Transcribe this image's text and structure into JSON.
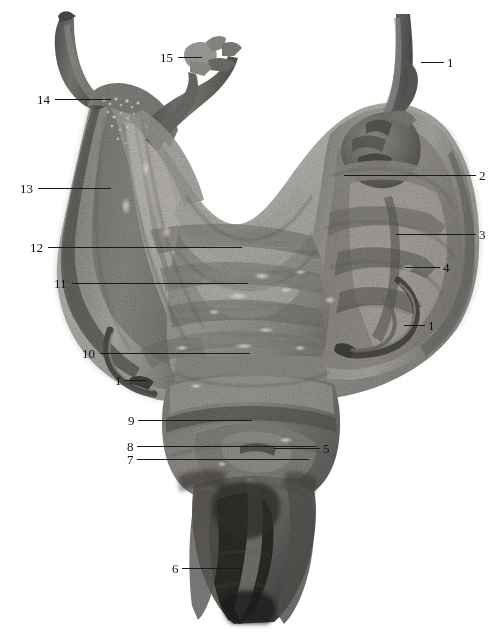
{
  "figure": {
    "kind": "anatomical-specimen-photograph",
    "orientation": "posterior view",
    "image_type": "grayscale photograph",
    "width_px": 499,
    "height_px": 635,
    "background_color": "#ffffff",
    "label_color": "#111111",
    "leader_line_color": "#1a1a1a",
    "tissue_tone_light": "#b9b7b2",
    "tissue_tone_mid": "#8e8c88",
    "tissue_tone_dark": "#5d5b58",
    "tissue_tone_darkest": "#2b2a28"
  },
  "labels": [
    {
      "id": "L1",
      "text": "1",
      "side": "right",
      "num_x": 447,
      "num_y": 56,
      "leader_x": 421,
      "leader_w": 23,
      "leader_y": 62
    },
    {
      "id": "L2",
      "text": "2",
      "side": "right",
      "num_x": 479,
      "num_y": 169,
      "leader_x": 344,
      "leader_w": 132,
      "leader_y": 175
    },
    {
      "id": "L3",
      "text": "3",
      "side": "right",
      "num_x": 479,
      "num_y": 228,
      "leader_x": 396,
      "leader_w": 80,
      "leader_y": 234
    },
    {
      "id": "L4",
      "text": "4",
      "side": "right",
      "num_x": 443,
      "num_y": 261,
      "leader_x": 405,
      "leader_w": 35,
      "leader_y": 267
    },
    {
      "id": "L1b",
      "text": "1",
      "side": "right",
      "num_x": 428,
      "num_y": 319,
      "leader_x": 404,
      "leader_w": 21,
      "leader_y": 325
    },
    {
      "id": "L5",
      "text": "5",
      "side": "right",
      "num_x": 323,
      "num_y": 442,
      "leader_x": 274,
      "leader_w": 46,
      "leader_y": 448
    },
    {
      "id": "L6",
      "text": "6",
      "side": "left",
      "num_x": 172,
      "num_y": 562,
      "leader_x": 182,
      "leader_w": 60,
      "leader_y": 568
    },
    {
      "id": "L7",
      "text": "7",
      "side": "left",
      "num_x": 127,
      "num_y": 453,
      "leader_x": 137,
      "leader_w": 172,
      "leader_y": 459
    },
    {
      "id": "L8",
      "text": "8",
      "side": "left",
      "num_x": 127,
      "num_y": 440,
      "leader_x": 137,
      "leader_w": 180,
      "leader_y": 446
    },
    {
      "id": "L9",
      "text": "9",
      "side": "left",
      "num_x": 128,
      "num_y": 414,
      "leader_x": 138,
      "leader_w": 114,
      "leader_y": 420
    },
    {
      "id": "L10",
      "text": "10",
      "side": "left",
      "num_x": 82,
      "num_y": 347,
      "leader_x": 100,
      "leader_w": 150,
      "leader_y": 353
    },
    {
      "id": "L1c",
      "text": "1",
      "side": "left",
      "num_x": 115,
      "num_y": 374,
      "leader_x": 124,
      "leader_w": 22,
      "leader_y": 380
    },
    {
      "id": "L11",
      "text": "11",
      "side": "left",
      "num_x": 54,
      "num_y": 277,
      "leader_x": 72,
      "leader_w": 176,
      "leader_y": 283
    },
    {
      "id": "L12",
      "text": "12",
      "side": "left",
      "num_x": 30,
      "num_y": 241,
      "leader_x": 48,
      "leader_w": 194,
      "leader_y": 247
    },
    {
      "id": "L13",
      "text": "13",
      "side": "left",
      "num_x": 20,
      "num_y": 182,
      "leader_x": 38,
      "leader_w": 73,
      "leader_y": 188
    },
    {
      "id": "L14",
      "text": "14",
      "side": "left",
      "num_x": 37,
      "num_y": 93,
      "leader_x": 55,
      "leader_w": 56,
      "leader_y": 99
    },
    {
      "id": "L15",
      "text": "15",
      "side": "left",
      "num_x": 160,
      "num_y": 51,
      "leader_x": 178,
      "leader_w": 24,
      "leader_y": 57
    }
  ]
}
